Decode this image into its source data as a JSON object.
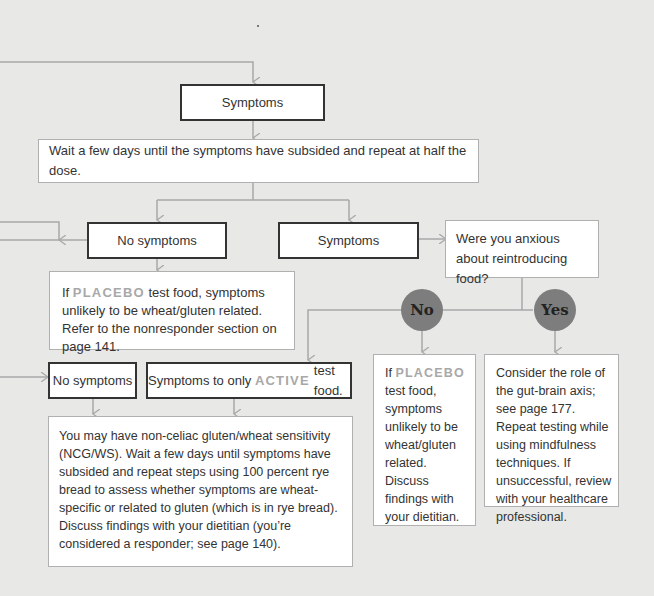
{
  "colors": {
    "background": "#e8e8e6",
    "connector": "#a8a8a8",
    "dark_border": "#333333",
    "light_border": "#b0b0b0",
    "accent_text": "#a8a8a8",
    "circle_fill": "#7d7d7d"
  },
  "nodes": {
    "symptoms_top": {
      "label": "Symptoms"
    },
    "wait_half_dose": {
      "label": "Wait a few days until the symptoms have subsided and repeat at half the dose."
    },
    "no_symptoms_mid": {
      "label": "No symptoms"
    },
    "symptoms_mid": {
      "label": "Symptoms"
    },
    "anxious_question": {
      "line1": "Were you anxious",
      "line2": "about reintroducing food?"
    },
    "placebo_note": {
      "pre": "If ",
      "accent": "PLACEBO",
      "post": " test food, symptoms unlikely to be wheat/gluten related. Refer to the nonresponder section on page 141."
    },
    "no_circle": {
      "label": "No"
    },
    "yes_circle": {
      "label": "Yes"
    },
    "no_symptoms_low": {
      "label": "No symptoms"
    },
    "symptoms_active": {
      "pre": "Symptoms to only ",
      "accent": "ACTIVE",
      "post": " test food."
    },
    "ncgws_note": {
      "label": "You may have non-celiac gluten/wheat sensitivity (NCG/WS). Wait a few days until symptoms have subsided and repeat steps using 100 percent rye bread to assess whether symptoms are wheat-specific or related to gluten (which is in rye bread). Discuss findings with your dietitian (you’re considered a responder; see page 140)."
    },
    "placebo_note_2": {
      "pre": "If ",
      "accent": "PLACEBO",
      "post": " test food, symptoms unlikely to be wheat/gluten related. Discuss findings with your dietitian."
    },
    "gut_brain_note": {
      "label": "Consider the role of the gut-brain axis; see page 177. Repeat testing while using mindfulness techniques. If unsuccessful, review with your healthcare professional."
    }
  }
}
